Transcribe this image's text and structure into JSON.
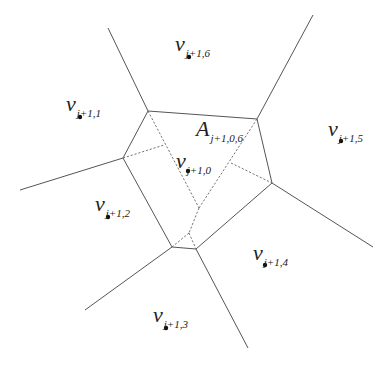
{
  "diagram": {
    "colors": {
      "edge": "#555555",
      "dashed": "#666666",
      "point": "#111111",
      "text": "#222222"
    },
    "sites": [
      {
        "id": "v0",
        "symbol": "v",
        "subscript": "j+1,0",
        "x": 188,
        "y": 171,
        "label_x": 176,
        "label_y": 150
      },
      {
        "id": "v1",
        "symbol": "v",
        "subscript": "j+1,1",
        "x": 80,
        "y": 117,
        "label_x": 66,
        "label_y": 93
      },
      {
        "id": "v2",
        "symbol": "v",
        "subscript": "j+1,2",
        "x": 108,
        "y": 217,
        "label_x": 95,
        "label_y": 193
      },
      {
        "id": "v3",
        "symbol": "v",
        "subscript": "j+1,3",
        "x": 166,
        "y": 328,
        "label_x": 153,
        "label_y": 304
      },
      {
        "id": "v4",
        "symbol": "v",
        "subscript": "j+1,4",
        "x": 265,
        "y": 265,
        "label_x": 253,
        "label_y": 242
      },
      {
        "id": "v5",
        "symbol": "v",
        "subscript": "j+1,5",
        "x": 341,
        "y": 141,
        "label_x": 328,
        "label_y": 118
      },
      {
        "id": "v6",
        "symbol": "v",
        "subscript": "j+1,6",
        "x": 189,
        "y": 57,
        "label_x": 175,
        "label_y": 33
      }
    ],
    "area_label": {
      "symbol": "A",
      "subscript": "j+1,0,6",
      "x": 196,
      "y": 118
    },
    "cell_polygon": [
      [
        148,
        111
      ],
      [
        257,
        119
      ],
      [
        272,
        183
      ],
      [
        196,
        249
      ],
      [
        172,
        247
      ],
      [
        123,
        158
      ]
    ],
    "outer_edges": [
      [
        [
          148,
          111
        ],
        [
          108,
          28
        ]
      ],
      [
        [
          257,
          119
        ],
        [
          313,
          15
        ]
      ],
      [
        [
          272,
          183
        ],
        [
          373,
          247
        ]
      ],
      [
        [
          196,
          249
        ],
        [
          248,
          348
        ]
      ],
      [
        [
          172,
          247
        ],
        [
          85,
          310
        ]
      ],
      [
        [
          123,
          158
        ],
        [
          20,
          190
        ]
      ]
    ],
    "dashed_edges": [
      [
        [
          148,
          111
        ],
        [
          199,
          208
        ]
      ],
      [
        [
          257,
          119
        ],
        [
          199,
          208
        ]
      ],
      [
        [
          199,
          208
        ],
        [
          189,
          233
        ]
      ],
      [
        [
          189,
          233
        ],
        [
          172,
          247
        ]
      ],
      [
        [
          189,
          233
        ],
        [
          196,
          249
        ]
      ],
      [
        [
          123,
          158
        ],
        [
          164,
          145
        ]
      ],
      [
        [
          231,
          163
        ],
        [
          272,
          183
        ]
      ]
    ]
  }
}
